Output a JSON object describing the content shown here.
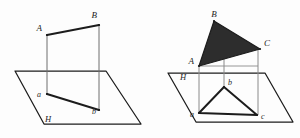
{
  "figure": {
    "background_color": "#fdfdfd",
    "stroke_color": "#1c1c1c",
    "thin_stroke_color": "#8a8a8a",
    "fill_color": "#2d2d2d",
    "panels": [
      {
        "name": "left-panel",
        "caption": "Segment AB and its projection ab on plane H",
        "plane_label": "H",
        "labels": [
          {
            "id": "A",
            "text": "A",
            "x": 42,
            "y": 31
          },
          {
            "id": "B",
            "text": "B",
            "x": 97,
            "y": 18
          },
          {
            "id": "a",
            "text": "a",
            "x": 41,
            "y": 97
          },
          {
            "id": "b",
            "text": "b",
            "x": 96,
            "y": 113
          },
          {
            "id": "H",
            "text": "H",
            "x": 45,
            "y": 122
          }
        ],
        "points": {
          "A": {
            "x": 47,
            "y": 35
          },
          "B": {
            "x": 99,
            "y": 25
          },
          "a": {
            "x": 47,
            "y": 94
          },
          "b": {
            "x": 99,
            "y": 110
          }
        },
        "plane_corners": [
          {
            "x": 15,
            "y": 71
          },
          {
            "x": 106,
            "y": 71
          },
          {
            "x": 141,
            "y": 124
          },
          {
            "x": 44,
            "y": 124
          }
        ]
      },
      {
        "name": "right-panel",
        "caption": "Triangle ABC and its projection abc on plane H",
        "plane_label": "H",
        "labels": [
          {
            "id": "A",
            "text": "A",
            "x": 190,
            "y": 62
          },
          {
            "id": "B",
            "text": "B",
            "x": 213,
            "y": 16
          },
          {
            "id": "C",
            "text": "C",
            "x": 264,
            "y": 44
          },
          {
            "id": "a",
            "text": "a",
            "x": 190,
            "y": 116
          },
          {
            "id": "b",
            "text": "b",
            "x": 226,
            "y": 82
          },
          {
            "id": "c",
            "text": "c",
            "x": 258,
            "y": 118
          },
          {
            "id": "H",
            "text": "H",
            "x": 182,
            "y": 76
          }
        ],
        "points": {
          "A": {
            "x": 199,
            "y": 66
          },
          "B": {
            "x": 214,
            "y": 21
          },
          "C": {
            "x": 260,
            "y": 49
          },
          "a": {
            "x": 199,
            "y": 113
          },
          "b": {
            "x": 224,
            "y": 87
          },
          "c": {
            "x": 257,
            "y": 115
          }
        },
        "plane_corners": [
          {
            "x": 168,
            "y": 73
          },
          {
            "x": 265,
            "y": 73
          },
          {
            "x": 293,
            "y": 122
          },
          {
            "x": 196,
            "y": 122
          }
        ]
      }
    ]
  }
}
